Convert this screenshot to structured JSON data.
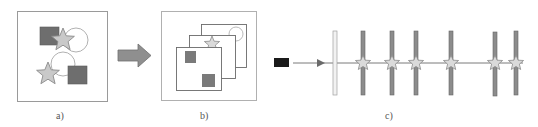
{
  "panels": {
    "a": {
      "label": "a)"
    },
    "b": {
      "label": "b)"
    },
    "c": {
      "label": "c)"
    }
  },
  "colors": {
    "frame": "#9a9a9a",
    "dark_square": "#6e6e6e",
    "star_fill": "#c9c9c9",
    "star_stroke": "#8a8a8a",
    "circle_stroke": "#a8a8a8",
    "arrow_fill": "#8f8f8f",
    "bar_fill": "#8c8c8c",
    "bar_light": "#f2f2f2",
    "camera": "#1a1a1a",
    "ray": "#7a7a7a"
  },
  "icons": {
    "arrow": "right-arrow-icon",
    "camera": "camera-icon",
    "star": "star-icon"
  }
}
